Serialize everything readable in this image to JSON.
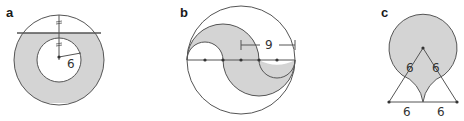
{
  "figures": [
    {
      "id": "a",
      "label": "a",
      "description": "Annulus with shaded region below a horizontal chord; inner radius 6",
      "measurements": {
        "inner_radius": "6"
      },
      "tick_marks": "equal segments marked on vertical radius"
    },
    {
      "id": "b",
      "label": "b",
      "description": "Circle with S-shaped shaded region formed by semicircles along diameter",
      "measurements": {
        "dimension": "9"
      }
    },
    {
      "id": "c",
      "label": "c",
      "description": "Circle atop equilateral triangle with shaded region",
      "measurements": {
        "side_left": "6",
        "side_right": "6",
        "base_left": "6",
        "base_right": "6"
      }
    }
  ],
  "colors": {
    "shade": "#d4d4d4",
    "stroke": "#555555",
    "text": "#1a1a1a"
  }
}
